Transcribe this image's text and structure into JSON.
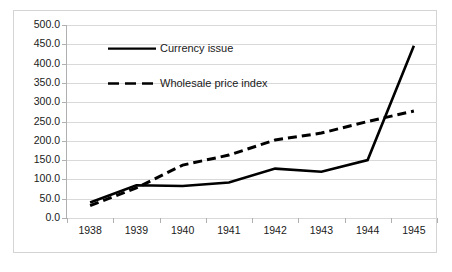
{
  "chart_data": {
    "type": "line",
    "title": "",
    "subtitle": "",
    "xlabel": "",
    "ylabel": "",
    "categories": [
      "1938",
      "1939",
      "1940",
      "1941",
      "1942",
      "1943",
      "1944",
      "1945"
    ],
    "x": [
      1938,
      1939,
      1940,
      1941,
      1942,
      1943,
      1944,
      1945
    ],
    "series": [
      {
        "name": "Currency issue",
        "style": "solid",
        "color": "#000000",
        "values": [
          40.0,
          85.0,
          83.0,
          92.0,
          128.0,
          120.0,
          150.0,
          446.0
        ]
      },
      {
        "name": "Wholesale price index",
        "style": "dashed",
        "color": "#000000",
        "values": [
          32.0,
          78.0,
          137.0,
          163.0,
          202.0,
          220.0,
          250.0,
          277.0
        ]
      }
    ],
    "ylim": [
      0.0,
      500.0
    ],
    "ytick_step": 50.0,
    "ytick_labels": [
      "0.0",
      "50.0",
      "100.0",
      "150.0",
      "200.0",
      "250.0",
      "300.0",
      "350.0",
      "400.0",
      "450.0",
      "500.0"
    ],
    "ytick_values": [
      0.0,
      50.0,
      100.0,
      150.0,
      200.0,
      250.0,
      300.0,
      350.0,
      400.0,
      450.0,
      500.0
    ],
    "xtick_labels": [
      "1938",
      "1939",
      "1940",
      "1941",
      "1942",
      "1943",
      "1944",
      "1945"
    ],
    "grid": "horizontal",
    "legend_position": "inside-upper-left",
    "legend": [
      "Currency issue",
      "Wholesale price index"
    ],
    "plot_background": "#ffffff",
    "gridline_color": "#d9d9d9",
    "axis_color": "#b0b0b0",
    "border_color": "#d4d4d4",
    "text_color": "#1a1a1a"
  }
}
